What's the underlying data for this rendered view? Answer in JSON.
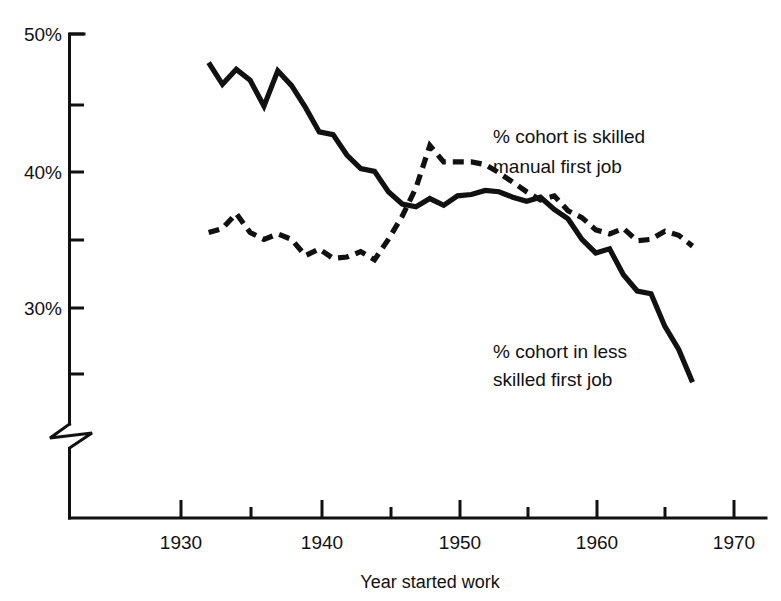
{
  "chart_data": {
    "type": "line",
    "title": "",
    "xlabel": "Year started work",
    "ylabel": "",
    "xlim": [
      1923,
      1972
    ],
    "ylim": [
      24,
      50
    ],
    "grid": false,
    "legend_position": "inline-annotations",
    "y_axis_break": true,
    "y_break_note": "axis broken below 25%",
    "x_ticks": [
      1930,
      1940,
      1950,
      1960,
      1970
    ],
    "x_tick_labels": [
      "1930",
      "1940",
      "1950",
      "1960",
      "1970"
    ],
    "x_minor_ticks": [
      1935,
      1945,
      1955,
      1965
    ],
    "y_ticks": [
      50,
      45,
      40,
      35,
      30,
      25
    ],
    "y_tick_labels": [
      "50%",
      "",
      "40%",
      "",
      "30%",
      ""
    ],
    "series": [
      {
        "name": "% cohort in less skilled first job",
        "style": "solid",
        "annotation": "% cohort in less\nskilled first job",
        "annotation_lines": [
          "% cohort in less",
          "skilled first job"
        ],
        "x": [
          1932,
          1933,
          1934,
          1935,
          1936,
          1937,
          1938,
          1939,
          1940,
          1941,
          1942,
          1943,
          1944,
          1945,
          1946,
          1947,
          1948,
          1949,
          1950,
          1951,
          1952,
          1953,
          1954,
          1955,
          1956,
          1957,
          1958,
          1959,
          1960,
          1961,
          1962,
          1963,
          1964,
          1965,
          1966,
          1967
        ],
        "values": [
          47.9,
          46.3,
          47.4,
          46.6,
          44.7,
          47.3,
          46.2,
          44.6,
          42.8,
          42.6,
          41.1,
          40.1,
          39.9,
          38.4,
          37.5,
          37.3,
          37.9,
          37.4,
          38.1,
          38.2,
          38.5,
          38.4,
          38.0,
          37.7,
          38.0,
          37.1,
          36.4,
          34.9,
          33.9,
          34.2,
          32.3,
          31.1,
          30.9,
          28.5,
          26.8,
          24.4
        ]
      },
      {
        "name": "% cohort is skilled manual first job",
        "style": "dashed",
        "annotation": "% cohort is skilled\nmanual first job",
        "annotation_lines": [
          "% cohort is skilled",
          "manual first job"
        ],
        "x": [
          1932,
          1933,
          1934,
          1935,
          1936,
          1937,
          1938,
          1939,
          1940,
          1941,
          1942,
          1943,
          1944,
          1945,
          1946,
          1947,
          1948,
          1949,
          1950,
          1951,
          1952,
          1953,
          1954,
          1955,
          1956,
          1957,
          1958,
          1959,
          1960,
          1961,
          1962,
          1963,
          1964,
          1965,
          1966,
          1967
        ],
        "values": [
          35.4,
          35.7,
          36.8,
          35.4,
          34.9,
          35.3,
          34.9,
          33.7,
          34.2,
          33.5,
          33.6,
          34.0,
          33.4,
          34.9,
          36.6,
          38.7,
          41.8,
          40.6,
          40.6,
          40.6,
          40.4,
          39.8,
          39.1,
          38.4,
          37.8,
          38.1,
          37.0,
          36.5,
          35.6,
          35.3,
          35.7,
          34.8,
          34.9,
          35.5,
          35.2,
          34.4
        ]
      }
    ]
  },
  "axis": {
    "xlabel": "Year started work",
    "y_tick_50": "50%",
    "y_tick_40": "40%",
    "y_tick_30": "30%",
    "x_tick_1930": "1930",
    "x_tick_1940": "1940",
    "x_tick_1950": "1950",
    "x_tick_1960": "1960",
    "x_tick_1970": "1970"
  },
  "annotations": {
    "skilled_line1": "% cohort is skilled",
    "skilled_line2": "manual first job",
    "less_skilled_line1": "% cohort in less",
    "less_skilled_line2": "skilled first job"
  },
  "colors": {
    "ink": "#111111",
    "paper": "#ffffff"
  }
}
